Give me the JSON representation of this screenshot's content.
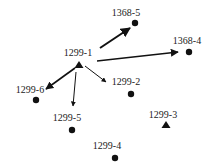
{
  "nodes": [
    {
      "id": "1368-5",
      "label": "1368-5",
      "shape": "circle",
      "x": 135,
      "y": 23,
      "lx": 126,
      "ly": 16
    },
    {
      "id": "1368-4",
      "label": "1368-4",
      "shape": "circle",
      "x": 189,
      "y": 52,
      "lx": 187,
      "ly": 44
    },
    {
      "id": "1299-1",
      "label": "1299-1",
      "shape": "triangle",
      "x": 79,
      "y": 65,
      "lx": 78,
      "ly": 56
    },
    {
      "id": "1299-2",
      "label": "1299-2",
      "shape": "circle",
      "x": 131,
      "y": 94,
      "lx": 126,
      "ly": 85
    },
    {
      "id": "1299-6",
      "label": "1299-6",
      "shape": "circle",
      "x": 36,
      "y": 100,
      "lx": 30,
      "ly": 93
    },
    {
      "id": "1299-5",
      "label": "1299-5",
      "shape": "circle",
      "x": 72,
      "y": 130,
      "lx": 67,
      "ly": 121
    },
    {
      "id": "1299-3",
      "label": "1299-3",
      "shape": "triangle",
      "x": 166,
      "y": 125,
      "lx": 163,
      "ly": 118
    },
    {
      "id": "1299-4",
      "label": "1299-4",
      "shape": "circle",
      "x": 115,
      "y": 158,
      "lx": 107,
      "ly": 149
    }
  ],
  "edges": [
    {
      "from": "1299-1",
      "to": "1368-5",
      "x1": 100,
      "y1": 48,
      "x2": 130,
      "y2": 28,
      "w": 2
    },
    {
      "from": "1299-1",
      "to": "1368-4",
      "x1": 97,
      "y1": 61,
      "x2": 178,
      "y2": 52,
      "w": 1.6
    },
    {
      "from": "1299-1",
      "to": "1299-6",
      "x1": 75,
      "y1": 68,
      "x2": 46,
      "y2": 89,
      "w": 1.6
    },
    {
      "from": "1299-1",
      "to": "1299-5",
      "x1": 76,
      "y1": 72,
      "x2": 73,
      "y2": 106,
      "w": 1
    },
    {
      "from": "1299-1",
      "to": "1299-2",
      "x1": 85,
      "y1": 66,
      "x2": 106,
      "y2": 82,
      "w": 1
    }
  ]
}
